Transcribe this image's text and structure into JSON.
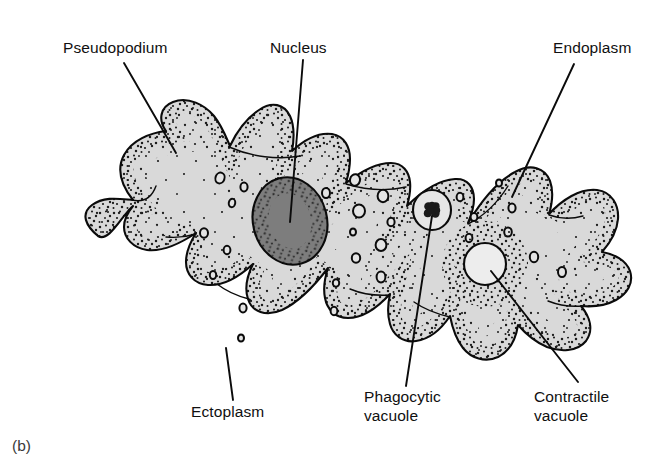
{
  "figure": {
    "caption": "(b)",
    "background_color": "#ffffff"
  },
  "colors": {
    "cytoplasm_fill": "#d9d9d9",
    "membrane_stroke": "#0b0b0b",
    "nucleus_fill": "#7d7d7d",
    "nucleus_stipple": "#2c2c2c",
    "stipple": "#1c1c1c",
    "contractile_vacuole_fill": "#ededed",
    "phagocytic_vacuole_fill": "#e6e6e6",
    "food_particle_fill": "#1a1a1a",
    "label_text": "#101010",
    "caption_text": "#3a3a3a"
  },
  "labels": [
    {
      "id": "pseudopodium",
      "lines": [
        "Pseudopodium"
      ],
      "text_x": 63,
      "text_y": 53,
      "anchor": "start",
      "leader": {
        "x1": 124,
        "y1": 63,
        "x2": 176,
        "y2": 153
      }
    },
    {
      "id": "nucleus",
      "lines": [
        "Nucleus"
      ],
      "text_x": 270,
      "text_y": 53,
      "anchor": "start",
      "leader": {
        "x1": 303,
        "y1": 60,
        "x2": 290,
        "y2": 222
      }
    },
    {
      "id": "endoplasm",
      "lines": [
        "Endoplasm"
      ],
      "text_x": 553,
      "text_y": 53,
      "anchor": "start",
      "leader": {
        "x1": 574,
        "y1": 64,
        "x2": 512,
        "y2": 197
      }
    },
    {
      "id": "ectoplasm",
      "lines": [
        "Ectoplasm"
      ],
      "text_x": 191,
      "text_y": 417,
      "anchor": "start",
      "leader": {
        "x1": 226,
        "y1": 348,
        "x2": 233,
        "y2": 400
      }
    },
    {
      "id": "phagocytic-vacuole",
      "lines": [
        "Phagocytic",
        "vacuole"
      ],
      "text_x": 364,
      "text_y": 402,
      "anchor": "start",
      "leader": {
        "x1": 432,
        "y1": 216,
        "x2": 406,
        "y2": 386
      }
    },
    {
      "id": "contractile-vacuole",
      "lines": [
        "Contractile",
        "vacuole"
      ],
      "text_x": 534,
      "text_y": 402,
      "anchor": "start",
      "leader": {
        "x1": 491,
        "y1": 271,
        "x2": 578,
        "y2": 382
      }
    }
  ],
  "organelles": {
    "nucleus": {
      "cx": 290,
      "cy": 221,
      "rx": 37,
      "ry": 44,
      "rotation": -14
    },
    "phagocytic_vacuole": {
      "cx": 432,
      "cy": 210,
      "rx": 19,
      "ry": 20,
      "food_particle_r": 9
    },
    "contractile_vacuole": {
      "cx": 485,
      "cy": 264,
      "rx": 21,
      "ry": 21
    },
    "small_vacuoles": [
      {
        "cx": 220,
        "cy": 178,
        "rx": 4.5,
        "ry": 5.5,
        "rot": 20
      },
      {
        "cx": 244,
        "cy": 187,
        "rx": 3.6,
        "ry": 4.4,
        "rot": 0
      },
      {
        "cx": 232,
        "cy": 203,
        "rx": 3.2,
        "ry": 4.2,
        "rot": 10
      },
      {
        "cx": 204,
        "cy": 233,
        "rx": 4.0,
        "ry": 4.8,
        "rot": 0
      },
      {
        "cx": 227,
        "cy": 250,
        "rx": 3.4,
        "ry": 4.2,
        "rot": 0
      },
      {
        "cx": 213,
        "cy": 275,
        "rx": 3.2,
        "ry": 4.0,
        "rot": 0
      },
      {
        "cx": 243,
        "cy": 308,
        "rx": 3.6,
        "ry": 4.4,
        "rot": 0
      },
      {
        "cx": 241,
        "cy": 338,
        "rx": 3.0,
        "ry": 3.6,
        "rot": 0
      },
      {
        "cx": 326,
        "cy": 193,
        "rx": 4.0,
        "ry": 5.0,
        "rot": 0
      },
      {
        "cx": 355,
        "cy": 180,
        "rx": 5.0,
        "ry": 5.8,
        "rot": 12
      },
      {
        "cx": 383,
        "cy": 196,
        "rx": 5.4,
        "ry": 6.2,
        "rot": 0
      },
      {
        "cx": 359,
        "cy": 211,
        "rx": 6.0,
        "ry": 6.6,
        "rot": 0
      },
      {
        "cx": 391,
        "cy": 222,
        "rx": 3.6,
        "ry": 4.2,
        "rot": 0
      },
      {
        "cx": 353,
        "cy": 232,
        "rx": 3.0,
        "ry": 3.6,
        "rot": 0
      },
      {
        "cx": 381,
        "cy": 245,
        "rx": 5.4,
        "ry": 6.0,
        "rot": 0
      },
      {
        "cx": 356,
        "cy": 258,
        "rx": 4.2,
        "ry": 4.8,
        "rot": 0
      },
      {
        "cx": 381,
        "cy": 277,
        "rx": 4.4,
        "ry": 5.4,
        "rot": 0
      },
      {
        "cx": 336,
        "cy": 283,
        "rx": 3.2,
        "ry": 3.8,
        "rot": 0
      },
      {
        "cx": 334,
        "cy": 311,
        "rx": 3.4,
        "ry": 4.2,
        "rot": 0
      },
      {
        "cx": 460,
        "cy": 197,
        "rx": 3.4,
        "ry": 4.2,
        "rot": 0
      },
      {
        "cx": 474,
        "cy": 217,
        "rx": 3.4,
        "ry": 4.0,
        "rot": 0
      },
      {
        "cx": 512,
        "cy": 208,
        "rx": 3.6,
        "ry": 4.4,
        "rot": 0
      },
      {
        "cx": 508,
        "cy": 232,
        "rx": 3.8,
        "ry": 4.6,
        "rot": 0
      },
      {
        "cx": 469,
        "cy": 238,
        "rx": 3.4,
        "ry": 4.2,
        "rot": 0
      },
      {
        "cx": 534,
        "cy": 257,
        "rx": 4.2,
        "ry": 5.2,
        "rot": 0
      },
      {
        "cx": 562,
        "cy": 272,
        "rx": 4.0,
        "ry": 5.0,
        "rot": 0
      },
      {
        "cx": 499,
        "cy": 183,
        "rx": 3.0,
        "ry": 3.6,
        "rot": 0
      }
    ]
  }
}
